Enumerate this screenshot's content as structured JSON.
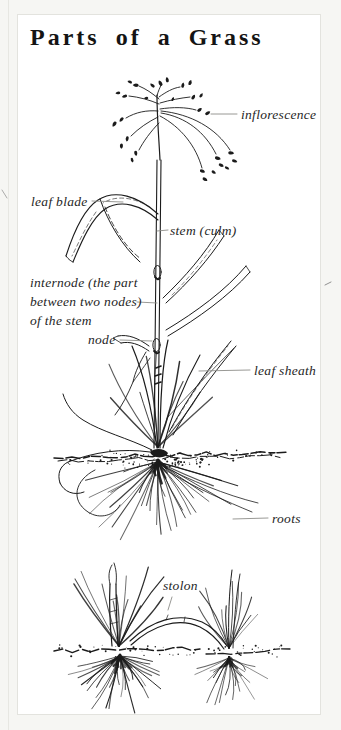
{
  "page": {
    "title": "Parts of a Grass"
  },
  "figure": {
    "labels": {
      "inflorescence": "inflorescence",
      "leaf_blade": "leaf blade",
      "stem": "stem (culm)",
      "internode_line1": "internode (the part",
      "internode_line2": "between two nodes)",
      "internode_line3": "of the stem",
      "node": "node",
      "leaf_sheath": "leaf sheath",
      "roots": "roots",
      "stolon": "stolon"
    }
  },
  "colors": {
    "page_bg": "#f6f6f3",
    "card_bg": "#ffffff",
    "card_border": "#e3e3de",
    "ink": "#1b1b1b",
    "label_text": "#262626",
    "leader_line": "#8d8d89",
    "title_text": "#141414"
  }
}
